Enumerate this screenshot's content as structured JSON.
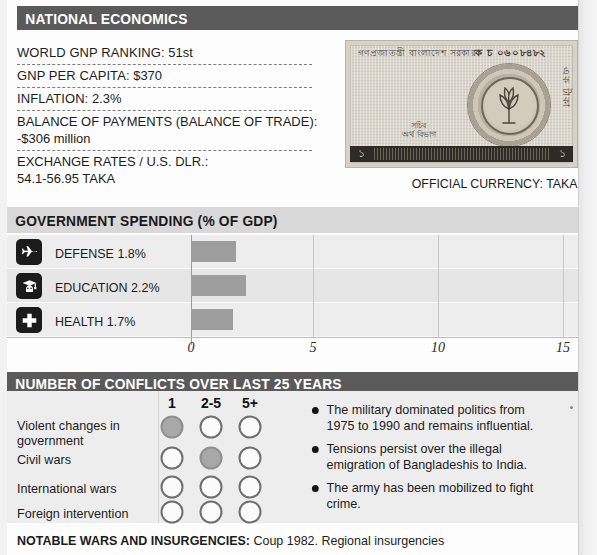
{
  "sections": {
    "economics": {
      "title": "NATIONAL ECONOMICS",
      "stats": [
        {
          "label": "WORLD GNP RANKING:",
          "value": "51st"
        },
        {
          "label": "GNP PER CAPITA:",
          "value": "$370"
        },
        {
          "label": "INFLATION:",
          "value": "2.3%"
        },
        {
          "label": "BALANCE OF PAYMENTS (BALANCE OF TRADE):",
          "value": "-$306 million"
        },
        {
          "label": "EXCHANGE RATES / U.S. DLR.:",
          "value": "54.1-56.95 TAKA"
        }
      ],
      "banknote": {
        "script_top": "গণপ্রজাতন্ত্রী বাংলাদেশ সরকার",
        "serial": "ক চ ০৬০৮৪৮২",
        "denomination_vertical": "এক টাকা",
        "signature": "সচিব",
        "signature_sub": "অর্থ বিভাগ",
        "corner_value": "১"
      },
      "currency_caption": "OFFICIAL CURRENCY: TAKA"
    },
    "spending": {
      "title": "GOVERNMENT SPENDING (% OF GDP)"
    },
    "conflicts": {
      "title": "NUMBER OF CONFLICTS OVER LAST 25 YEARS",
      "column_headers": [
        "1",
        "2-5",
        "5+"
      ],
      "rows": [
        {
          "label": "Violent changes in\ngovernment",
          "marks": [
            true,
            false,
            false
          ]
        },
        {
          "label": "Civil wars",
          "marks": [
            false,
            true,
            false
          ]
        },
        {
          "label": "International wars",
          "marks": [
            false,
            false,
            false
          ]
        },
        {
          "label": "Foreign intervention",
          "marks": [
            false,
            false,
            false
          ]
        }
      ],
      "bullets": [
        "The military dominated politics from 1975 to 1990 and remains influential.",
        "Tensions persist over the illegal emigration of Bangladeshis to India.",
        "The army has been mobilized to fight crime."
      ]
    },
    "footer": {
      "label": "NOTABLE WARS AND INSURGENCIES:",
      "text": "Coup 1982. Regional insurgencies"
    }
  },
  "chart_data": {
    "type": "bar",
    "orientation": "horizontal",
    "title": "GOVERNMENT SPENDING (% OF GDP)",
    "categories": [
      "DEFENSE",
      "EDUCATION",
      "HEALTH"
    ],
    "category_labels": [
      "DEFENSE 1.8%",
      "EDUCATION 2.2%",
      "HEALTH 1.7%"
    ],
    "category_icons": [
      "fighter-jet-icon",
      "graduation-cap-icon",
      "medical-cross-icon"
    ],
    "values": [
      1.8,
      2.2,
      1.7
    ],
    "xlabel": "",
    "ylabel": "",
    "xlim": [
      0,
      15
    ],
    "xticks": [
      0,
      5,
      10,
      15
    ],
    "xtick_labels": [
      "0",
      "5",
      "10",
      "15"
    ],
    "grid": true,
    "legend": false,
    "bar_color": "#9e9e9e"
  },
  "colors": {
    "header_dark": "#5a5a5a",
    "header_light": "#d8d8d8",
    "bar_fill": "#9e9e9e",
    "panel_bg": "#ededed",
    "icon_bg": "#1b1b1b",
    "text": "#1c1c1c"
  }
}
